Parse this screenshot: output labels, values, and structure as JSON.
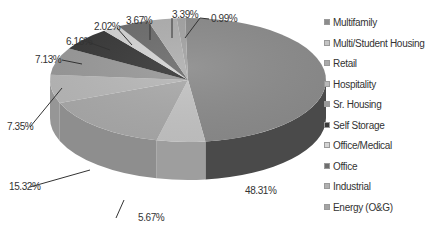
{
  "chart_data": {
    "type": "pie",
    "style": "3d",
    "title": "",
    "legend_position": "right",
    "categories": [
      "Multifamily",
      "Multi/Student Housing",
      "Retail",
      "Hospitality",
      "Sr. Housing",
      "Self Storage",
      "Office/Medical",
      "Office",
      "Industrial",
      "Energy (O&G)"
    ],
    "values": [
      48.31,
      5.67,
      15.32,
      7.35,
      7.13,
      6.16,
      2.02,
      3.67,
      3.39,
      0.99
    ],
    "value_labels": [
      "48.31%",
      "5.67%",
      "15.32%",
      "7.35%",
      "7.13%",
      "6.16%",
      "2.02%",
      "3.67%",
      "3.39%",
      "0.99%"
    ],
    "colors": [
      "#8c8c8c",
      "#c4c4c4",
      "#aaaaaa",
      "#b8b8b8",
      "#9a9a9a",
      "#3a3a3a",
      "#d4d4d4",
      "#6e6e6e",
      "#b0b0b0",
      "#a4a4a4"
    ],
    "side_colors": [
      "#4a4a4a",
      "#9e9e9e",
      "#8e8e8e",
      "#969696",
      "#7a7a7a",
      "#1e1e1e",
      "#b0b0b0",
      "#4e4e4e",
      "#909090",
      "#848484"
    ]
  },
  "legend": {
    "items": [
      {
        "label": "Multifamily",
        "color": "#8c8c8c"
      },
      {
        "label": "Multi/Student Housing",
        "color": "#c4c4c4"
      },
      {
        "label": "Retail",
        "color": "#aaaaaa"
      },
      {
        "label": "Hospitality",
        "color": "#b8b8b8"
      },
      {
        "label": "Sr. Housing",
        "color": "#9a9a9a"
      },
      {
        "label": "Self Storage",
        "color": "#3a3a3a"
      },
      {
        "label": "Office/Medical",
        "color": "#d4d4d4"
      },
      {
        "label": "Office",
        "color": "#6e6e6e"
      },
      {
        "label": "Industrial",
        "color": "#b0b0b0"
      },
      {
        "label": "Energy (O&G)",
        "color": "#a4a4a4"
      }
    ]
  },
  "labels": {
    "multifamily": "48.31%",
    "multi_student": "5.67%",
    "retail": "15.32%",
    "hospitality": "7.35%",
    "sr_housing": "7.13%",
    "self_storage": "6.16%",
    "office_medical": "2.02%",
    "office": "3.67%",
    "industrial": "3.39%",
    "energy": "0.99%"
  }
}
